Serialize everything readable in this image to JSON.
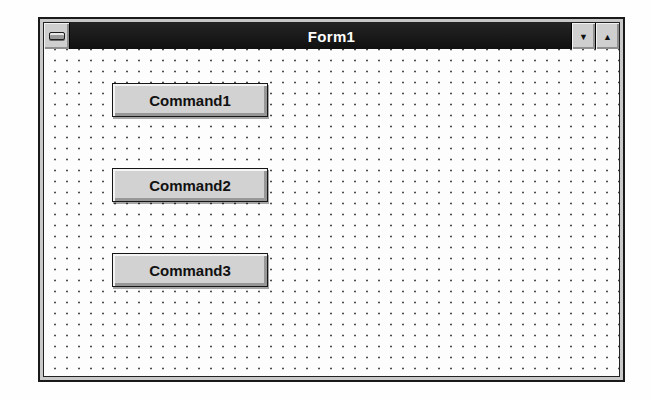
{
  "window": {
    "title": "Form1",
    "titlebar": {
      "control_menu_icon": "control-menu-box",
      "minimize_glyph": "▼",
      "maximize_glyph": "▲"
    },
    "form": {
      "buttons": [
        {
          "label": "Command1"
        },
        {
          "label": "Command2"
        },
        {
          "label": "Command3"
        }
      ]
    }
  },
  "colors": {
    "titlebar_bg": "#161616",
    "titlebar_text": "#ffffff",
    "window_frame": "#c9c9c9",
    "button_face": "#d2d2d2",
    "button_text": "#111111",
    "client_bg": "#fdfdfd",
    "grid_dot": "#4c4c4c"
  }
}
